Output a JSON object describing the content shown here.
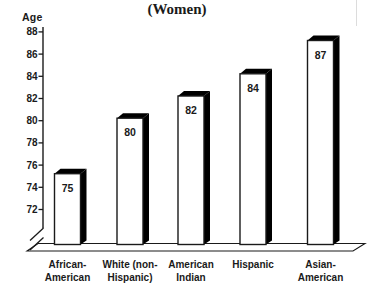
{
  "chart_data": {
    "type": "bar",
    "title": "(Women)",
    "ylabel": "Age",
    "categories": [
      "African-American",
      "White (non-Hispanic)",
      "American Indian",
      "Hispanic",
      "Asian-American"
    ],
    "category_lines": [
      [
        "African-",
        "American"
      ],
      [
        "White (non-",
        "Hispanic)"
      ],
      [
        "American",
        "Indian"
      ],
      [
        "Hispanic"
      ],
      [
        "Asian-",
        "American"
      ]
    ],
    "values": [
      75,
      80,
      82,
      84,
      87
    ],
    "value_labels": [
      "75",
      "80",
      "82",
      "84",
      "87"
    ],
    "yticks": [
      88,
      86,
      84,
      82,
      80,
      78,
      76,
      74,
      72
    ],
    "ylim": [
      72,
      88
    ],
    "axis_break": true,
    "grid": false,
    "legend": "none",
    "colors": {
      "bar_face": "#ffffff",
      "bar_side": "#000000",
      "bar_top": "#000000",
      "outline": "#1a1a1a",
      "text": "#1a1a1a",
      "background": "#ffffff"
    }
  }
}
